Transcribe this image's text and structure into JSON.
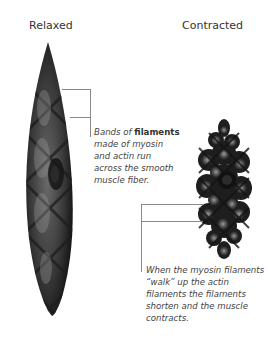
{
  "labels": {
    "relaxed": "Relaxed",
    "contracted": "Contracted"
  },
  "captions": {
    "relaxed": {
      "prefix": "Bands of ",
      "emphasis": "filaments",
      "lines": [
        "made of myosin",
        "and actin run",
        "across the smooth",
        "muscle fiber."
      ]
    },
    "contracted": {
      "lines": [
        "When the myosin filaments",
        "“walk” up the actin",
        "filaments the filaments",
        "shorten and the muscle",
        "contracts."
      ]
    }
  },
  "colors": {
    "fiber_dark": "#1a1a1a",
    "fiber_mid": "#555555",
    "fiber_light": "#8c8c8c",
    "callout_line": "#8a8a8a"
  }
}
